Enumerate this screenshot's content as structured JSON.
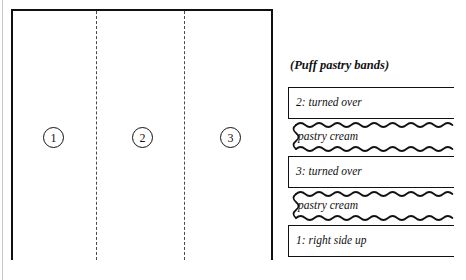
{
  "dough_sheet": {
    "name": "rolled dough sheet",
    "sections": [
      {
        "marker": "1"
      },
      {
        "marker": "2"
      },
      {
        "marker": "3"
      }
    ],
    "fold_lines": 2,
    "line_color": "#111111",
    "fold_line_style": "dashed"
  },
  "legend": {
    "caption": "(Puff pastry bands)",
    "bands": [
      {
        "label": "2: turned over",
        "kind": "dough"
      },
      {
        "label": "pastry cream",
        "kind": "cream"
      },
      {
        "label": "3: turned over",
        "kind": "dough"
      },
      {
        "label": "pastry cream",
        "kind": "cream"
      },
      {
        "label": "1: right side up",
        "kind": "dough"
      }
    ]
  }
}
